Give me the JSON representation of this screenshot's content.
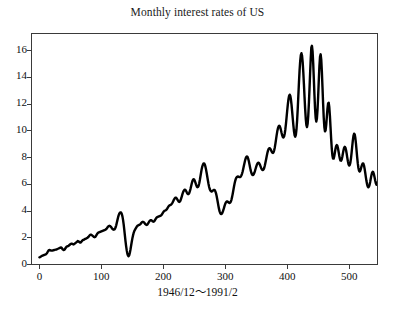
{
  "chart_data": {
    "type": "line",
    "title": "Monthly interest rates of US",
    "xlabel": "1946/12〜1991/2",
    "ylabel": "",
    "xlim": [
      -12,
      545
    ],
    "ylim": [
      0,
      17.2
    ],
    "grid": false,
    "legend": null,
    "line_color": "#000000",
    "line_width": 2.4,
    "xticks": [
      0,
      100,
      200,
      300,
      400,
      500
    ],
    "xticklabels": [
      "0",
      "100",
      "200",
      "300",
      "400",
      "500"
    ],
    "yticks": [
      0,
      2,
      4,
      6,
      8,
      10,
      12,
      14,
      16
    ],
    "yticklabels": [
      "0",
      "2",
      "4",
      "6",
      "8",
      "10",
      "12",
      "14",
      "16"
    ],
    "series": [
      {
        "name": "Monthly interest rate",
        "x_start": 0,
        "x_step": 1,
        "values": [
          0.5,
          0.52,
          0.55,
          0.58,
          0.6,
          0.62,
          0.64,
          0.66,
          0.68,
          0.7,
          0.72,
          0.75,
          0.8,
          0.88,
          0.96,
          1.02,
          1.05,
          1.04,
          1.02,
          1.0,
          1.0,
          1.01,
          1.02,
          1.03,
          1.05,
          1.06,
          1.07,
          1.08,
          1.1,
          1.12,
          1.14,
          1.16,
          1.18,
          1.2,
          1.22,
          1.24,
          1.2,
          1.12,
          1.08,
          1.05,
          1.06,
          1.1,
          1.18,
          1.25,
          1.3,
          1.32,
          1.34,
          1.36,
          1.4,
          1.44,
          1.48,
          1.5,
          1.52,
          1.5,
          1.48,
          1.46,
          1.48,
          1.52,
          1.56,
          1.6,
          1.64,
          1.68,
          1.72,
          1.7,
          1.66,
          1.62,
          1.6,
          1.62,
          1.68,
          1.74,
          1.78,
          1.8,
          1.82,
          1.85,
          1.88,
          1.9,
          1.92,
          1.95,
          1.98,
          2.02,
          2.08,
          2.14,
          2.18,
          2.2,
          2.18,
          2.14,
          2.1,
          2.06,
          2.02,
          2.0,
          2.02,
          2.08,
          2.16,
          2.24,
          2.3,
          2.34,
          2.36,
          2.38,
          2.4,
          2.42,
          2.44,
          2.46,
          2.48,
          2.5,
          2.52,
          2.54,
          2.56,
          2.58,
          2.62,
          2.68,
          2.74,
          2.8,
          2.84,
          2.86,
          2.84,
          2.8,
          2.74,
          2.68,
          2.62,
          2.58,
          2.56,
          2.58,
          2.64,
          2.74,
          2.9,
          3.1,
          3.3,
          3.5,
          3.66,
          3.78,
          3.84,
          3.86,
          3.84,
          3.74,
          3.56,
          3.3,
          2.96,
          2.56,
          2.12,
          1.7,
          1.32,
          1.0,
          0.76,
          0.62,
          0.58,
          0.66,
          0.84,
          1.08,
          1.36,
          1.64,
          1.9,
          2.12,
          2.3,
          2.44,
          2.54,
          2.62,
          2.7,
          2.78,
          2.84,
          2.88,
          2.9,
          2.92,
          2.94,
          2.98,
          3.04,
          3.1,
          3.14,
          3.16,
          3.14,
          3.1,
          3.04,
          2.98,
          2.94,
          2.92,
          2.94,
          3.0,
          3.08,
          3.16,
          3.22,
          3.26,
          3.28,
          3.26,
          3.22,
          3.18,
          3.16,
          3.18,
          3.24,
          3.32,
          3.4,
          3.46,
          3.5,
          3.52,
          3.54,
          3.56,
          3.58,
          3.6,
          3.62,
          3.66,
          3.72,
          3.8,
          3.88,
          3.94,
          3.98,
          4.0,
          4.02,
          4.06,
          4.12,
          4.2,
          4.28,
          4.34,
          4.38,
          4.4,
          4.42,
          4.46,
          4.52,
          4.6,
          4.7,
          4.8,
          4.88,
          4.94,
          4.96,
          4.94,
          4.88,
          4.8,
          4.72,
          4.66,
          4.64,
          4.68,
          4.78,
          4.92,
          5.08,
          5.24,
          5.38,
          5.48,
          5.54,
          5.56,
          5.52,
          5.44,
          5.34,
          5.26,
          5.22,
          5.24,
          5.32,
          5.46,
          5.64,
          5.84,
          6.04,
          6.2,
          6.3,
          6.34,
          6.3,
          6.2,
          6.06,
          5.92,
          5.8,
          5.74,
          5.76,
          5.86,
          6.04,
          6.28,
          6.56,
          6.84,
          7.1,
          7.3,
          7.44,
          7.52,
          7.52,
          7.44,
          7.28,
          7.06,
          6.8,
          6.52,
          6.24,
          5.98,
          5.76,
          5.6,
          5.5,
          5.44,
          5.42,
          5.44,
          5.48,
          5.52,
          5.54,
          5.52,
          5.44,
          5.3,
          5.1,
          4.86,
          4.6,
          4.34,
          4.1,
          3.92,
          3.8,
          3.74,
          3.74,
          3.8,
          3.9,
          4.04,
          4.2,
          4.36,
          4.5,
          4.6,
          4.66,
          4.68,
          4.66,
          4.62,
          4.58,
          4.56,
          4.58,
          4.66,
          4.8,
          5.0,
          5.24,
          5.5,
          5.76,
          6.0,
          6.2,
          6.36,
          6.46,
          6.52,
          6.54,
          6.54,
          6.52,
          6.5,
          6.5,
          6.54,
          6.62,
          6.74,
          6.9,
          7.1,
          7.32,
          7.54,
          7.74,
          7.9,
          8.0,
          8.04,
          8.0,
          7.88,
          7.7,
          7.48,
          7.24,
          7.02,
          6.84,
          6.72,
          6.66,
          6.66,
          6.72,
          6.82,
          6.96,
          7.12,
          7.28,
          7.42,
          7.52,
          7.58,
          7.58,
          7.52,
          7.42,
          7.3,
          7.18,
          7.08,
          7.02,
          7.02,
          7.08,
          7.2,
          7.38,
          7.6,
          7.84,
          8.08,
          8.3,
          8.48,
          8.6,
          8.66,
          8.66,
          8.6,
          8.5,
          8.4,
          8.32,
          8.3,
          8.36,
          8.5,
          8.72,
          9.0,
          9.32,
          9.64,
          9.92,
          10.14,
          10.28,
          10.34,
          10.3,
          10.18,
          10.0,
          9.8,
          9.62,
          9.5,
          9.46,
          9.54,
          9.74,
          10.06,
          10.48,
          10.96,
          11.46,
          11.92,
          12.3,
          12.56,
          12.66,
          12.58,
          12.32,
          11.92,
          11.42,
          10.88,
          10.36,
          9.92,
          9.62,
          9.52,
          9.66,
          10.06,
          10.72,
          11.58,
          12.58,
          13.58,
          14.48,
          15.18,
          15.62,
          15.76,
          15.58,
          15.1,
          14.36,
          13.46,
          12.5,
          11.6,
          10.86,
          10.38,
          10.24,
          10.48,
          11.08,
          11.98,
          13.08,
          14.26,
          15.36,
          16.2,
          16.32,
          15.9,
          15.02,
          13.86,
          12.66,
          11.62,
          10.92,
          10.66,
          10.88,
          11.54,
          12.54,
          13.7,
          14.78,
          15.5,
          15.68,
          15.28,
          14.4,
          13.22,
          12.0,
          10.96,
          10.24,
          9.92,
          10.0,
          10.4,
          11.0,
          11.6,
          12.0,
          12.06,
          11.72,
          11.06,
          10.2,
          9.34,
          8.62,
          8.12,
          7.88,
          7.88,
          8.06,
          8.34,
          8.62,
          8.82,
          8.9,
          8.84,
          8.66,
          8.4,
          8.12,
          7.88,
          7.74,
          7.72,
          7.82,
          8.02,
          8.28,
          8.52,
          8.7,
          8.76,
          8.7,
          8.52,
          8.26,
          7.96,
          7.68,
          7.46,
          7.36,
          7.4,
          7.58,
          7.9,
          8.32,
          8.8,
          9.24,
          9.58,
          9.74,
          9.7,
          9.44,
          9.02,
          8.5,
          7.98,
          7.52,
          7.18,
          6.98,
          6.92,
          6.98,
          7.12,
          7.3,
          7.44,
          7.52,
          7.5,
          7.36,
          7.12,
          6.82,
          6.5,
          6.2,
          5.96,
          5.8,
          5.74,
          5.78,
          5.92,
          6.14,
          6.4,
          6.64,
          6.82,
          6.9,
          6.86,
          6.72,
          6.5,
          6.26,
          6.06,
          5.94,
          5.92,
          6.02,
          6.22,
          6.5,
          6.82,
          7.12,
          7.36,
          7.52,
          7.58,
          7.54,
          7.42,
          7.26,
          7.1,
          7.0,
          6.98,
          7.06,
          7.24,
          7.48,
          7.72,
          7.9,
          7.98,
          7.94,
          7.8,
          7.58,
          7.32,
          7.06,
          6.84,
          6.68,
          6.6,
          6.62,
          6.72,
          6.86,
          7.0,
          7.08,
          7.06,
          6.92,
          6.7,
          6.44,
          6.2,
          6.02,
          5.92,
          5.9,
          5.94,
          6.02,
          6.1,
          6.14,
          6.12,
          6.04,
          5.92,
          5.82,
          5.74,
          5.7,
          5.7,
          5.72,
          5.74,
          5.72,
          5.68
        ]
      }
    ]
  },
  "axes": {
    "y_ticks": [
      {
        "value": 16,
        "label": "16"
      },
      {
        "value": 14,
        "label": "14"
      },
      {
        "value": 12,
        "label": "12"
      },
      {
        "value": 10,
        "label": "10"
      },
      {
        "value": 8,
        "label": "8"
      },
      {
        "value": 6,
        "label": "6"
      },
      {
        "value": 4,
        "label": "4"
      },
      {
        "value": 2,
        "label": "2"
      },
      {
        "value": 0,
        "label": "0"
      }
    ],
    "x_ticks": [
      {
        "value": 0,
        "label": "0"
      },
      {
        "value": 100,
        "label": "100"
      },
      {
        "value": 200,
        "label": "200"
      },
      {
        "value": 300,
        "label": "300"
      },
      {
        "value": 400,
        "label": "400"
      },
      {
        "value": 500,
        "label": "500"
      }
    ]
  }
}
